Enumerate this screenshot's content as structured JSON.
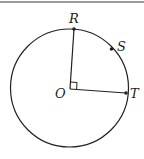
{
  "diagram": {
    "type": "circle-geometry",
    "labels": {
      "center": "O",
      "point_r": "R",
      "point_s": "S",
      "point_t": "T"
    },
    "angle_marker": "right-angle",
    "colors": {
      "stroke": "#222222",
      "background": "#ffffff",
      "top_rule": "#9a9a9a"
    }
  }
}
